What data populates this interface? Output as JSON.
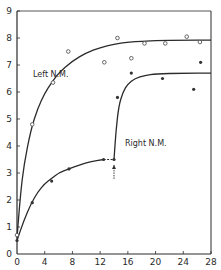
{
  "chart_data": {
    "type": "scatter",
    "title": "",
    "xlabel": "",
    "ylabel": "",
    "xlim": [
      0,
      28
    ],
    "ylim": [
      0,
      9
    ],
    "grid": false,
    "x_ticks": [
      0,
      4,
      8,
      12,
      16,
      20,
      24,
      28
    ],
    "x_tick_labels": [
      "0",
      "4",
      "8",
      "12",
      "16",
      "20",
      "24",
      "28"
    ],
    "y_ticks": [
      0,
      1,
      2,
      3,
      4,
      5,
      6,
      7,
      8,
      9
    ],
    "y_tick_labels": [
      "0",
      "1",
      "2",
      "3",
      "4",
      "5",
      "6",
      "7",
      "8",
      "9"
    ],
    "legend": "inline labels",
    "series": [
      {
        "name": "Left N.M.",
        "marker": "open-circle",
        "points": [
          [
            0,
            0.7
          ],
          [
            2.2,
            4.8
          ],
          [
            5.2,
            6.35
          ],
          [
            7.4,
            7.5
          ],
          [
            12.6,
            7.1
          ],
          [
            14.5,
            8.0
          ],
          [
            16.5,
            7.25
          ],
          [
            18.4,
            7.8
          ],
          [
            21.4,
            7.8
          ],
          [
            24.5,
            8.05
          ],
          [
            26.4,
            7.85
          ]
        ],
        "fit_curve": [
          [
            0,
            0.6
          ],
          [
            0.5,
            2.2
          ],
          [
            1,
            3.3
          ],
          [
            2,
            4.6
          ],
          [
            3,
            5.4
          ],
          [
            4,
            5.95
          ],
          [
            5,
            6.35
          ],
          [
            6,
            6.7
          ],
          [
            8,
            7.15
          ],
          [
            10,
            7.45
          ],
          [
            12,
            7.65
          ],
          [
            14,
            7.77
          ],
          [
            16,
            7.85
          ],
          [
            20,
            7.9
          ],
          [
            24,
            7.92
          ],
          [
            28,
            7.92
          ]
        ]
      },
      {
        "name": "Right N.M.",
        "marker": "filled-dot",
        "points": [
          [
            0,
            0.5
          ],
          [
            2.2,
            1.9
          ],
          [
            5.0,
            2.7
          ],
          [
            7.5,
            3.15
          ],
          [
            12.5,
            3.5
          ],
          [
            14.0,
            3.5
          ],
          [
            14.5,
            5.8
          ],
          [
            16.5,
            6.7
          ],
          [
            21.0,
            6.5
          ],
          [
            25.5,
            6.1
          ],
          [
            26.5,
            7.1
          ]
        ],
        "fit_curve": [
          [
            0,
            0.5
          ],
          [
            1,
            1.25
          ],
          [
            2,
            1.85
          ],
          [
            3,
            2.3
          ],
          [
            4,
            2.6
          ],
          [
            5,
            2.8
          ],
          [
            6,
            3.0
          ],
          [
            7.5,
            3.15
          ],
          [
            9,
            3.3
          ],
          [
            10.5,
            3.42
          ],
          [
            12.5,
            3.5
          ]
        ],
        "dashed_segment": [
          [
            12.5,
            3.5
          ],
          [
            14.0,
            3.5
          ]
        ],
        "fit_curve_2": [
          [
            14.0,
            3.5
          ],
          [
            14.3,
            4.6
          ],
          [
            14.7,
            5.5
          ],
          [
            15.3,
            6.0
          ],
          [
            16,
            6.3
          ],
          [
            17,
            6.5
          ],
          [
            18.5,
            6.62
          ],
          [
            20,
            6.67
          ],
          [
            24,
            6.7
          ],
          [
            28,
            6.7
          ]
        ]
      }
    ],
    "annotations": [
      {
        "text": "Left N.M.",
        "x": 2.3,
        "y": 7.1
      },
      {
        "text": "Right N.M.",
        "x": 15.5,
        "y": 4.3
      },
      {
        "text": "arrow-up",
        "x": 14.0,
        "y": 3.1
      }
    ]
  },
  "labels": {
    "left": "Left N.M.",
    "right": "Right N.M."
  }
}
